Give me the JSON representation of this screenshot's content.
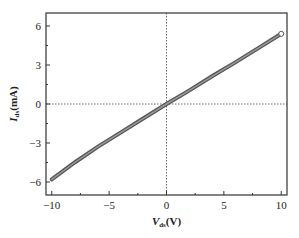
{
  "chart_data": {
    "type": "line",
    "title": "",
    "xlabel": "V_ds(V)",
    "ylabel": "I_ds(mA)",
    "xlim": [
      -10.5,
      10.5
    ],
    "ylim": [
      -7,
      7
    ],
    "xticks": [
      -10,
      -5,
      0,
      5,
      10
    ],
    "yticks": [
      -6,
      -3,
      0,
      3,
      6
    ],
    "grid": false,
    "reference_lines": {
      "x": 0,
      "y": 0,
      "style": "dotted"
    },
    "series": [
      {
        "name": "I-V",
        "x": [
          -10,
          -8,
          -6,
          -4,
          -2,
          0,
          2,
          4,
          6,
          8,
          10
        ],
        "values": [
          -5.8,
          -4.5,
          -3.3,
          -2.2,
          -1.1,
          0,
          1.05,
          2.15,
          3.2,
          4.3,
          5.4
        ]
      }
    ]
  },
  "axes": {
    "xlabel_main": "V",
    "xlabel_sub": "ds",
    "xlabel_unit": "(V)",
    "ylabel_main": "I",
    "ylabel_sub": "ds",
    "ylabel_unit": "(mA)"
  }
}
